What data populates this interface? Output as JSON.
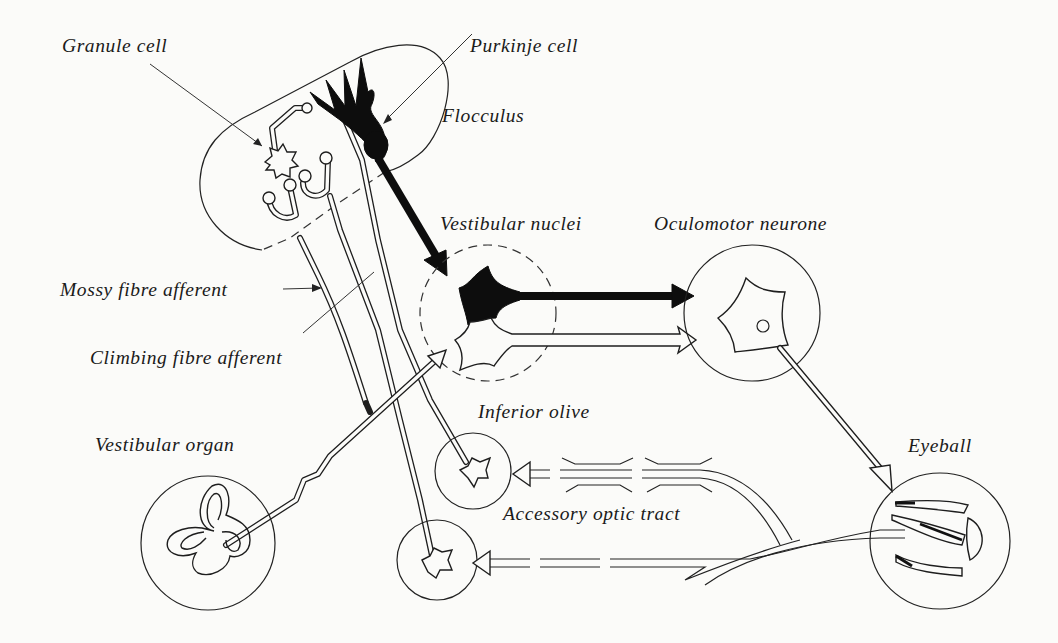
{
  "figure": {
    "type": "neuroanatomical schematic"
  },
  "labels": {
    "granule_cell": "Granule cell",
    "purkinje_cell": "Purkinje cell",
    "flocculus": "Flocculus",
    "vestibular_nuclei": "Vestibular nuclei",
    "oculomotor_neurone": "Oculomotor neurone",
    "mossy_fibre_afferent": "Mossy fibre afferent",
    "climbing_fibre_afferent": "Climbing fibre afferent",
    "inferior_olive": "Inferior olive",
    "vestibular_organ": "Vestibular organ",
    "eyeball": "Eyeball",
    "accessory_optic_tract": "Accessory optic tract"
  },
  "nodes": [
    {
      "id": "flocculus",
      "label": "Flocculus",
      "shape": "rounded-lobe",
      "border": "solid+dashed"
    },
    {
      "id": "vestibular_nuclei",
      "label": "Vestibular nuclei",
      "shape": "circle",
      "border": "dashed"
    },
    {
      "id": "oculomotor_neurone",
      "label": "Oculomotor neurone",
      "shape": "circle",
      "border": "solid"
    },
    {
      "id": "inferior_olive",
      "label": "Inferior olive",
      "shape": "circle",
      "border": "solid"
    },
    {
      "id": "pontine_relay",
      "label": "",
      "shape": "circle",
      "border": "solid"
    },
    {
      "id": "vestibular_organ",
      "label": "Vestibular organ",
      "shape": "circle",
      "border": "solid"
    },
    {
      "id": "eyeball",
      "label": "Eyeball",
      "shape": "circle",
      "border": "solid"
    }
  ],
  "edges": [
    {
      "from": "Purkinje cell",
      "to": "Vestibular nuclei",
      "style": "solid-black",
      "meaning": "inhibitory"
    },
    {
      "from": "Vestibular nuclei",
      "to": "Oculomotor neurone",
      "style": "solid-black"
    },
    {
      "from": "Vestibular nuclei",
      "to": "Oculomotor neurone",
      "style": "hollow"
    },
    {
      "from": "Vestibular organ",
      "to": "Vestibular nuclei",
      "style": "hollow"
    },
    {
      "from": "Vestibular organ",
      "to": "Flocculus",
      "style": "mossy fibre"
    },
    {
      "from": "Oculomotor neurone",
      "to": "Eyeball",
      "style": "hollow"
    },
    {
      "from": "Eyeball",
      "to": "Inferior olive",
      "style": "hollow",
      "via": "Accessory optic tract"
    },
    {
      "from": "Eyeball",
      "to": "pontine relay",
      "style": "hollow"
    },
    {
      "from": "Inferior olive",
      "to": "Flocculus",
      "style": "climbing fibre"
    },
    {
      "from": "pontine relay",
      "to": "Flocculus",
      "style": "mossy fibre"
    }
  ],
  "colors": {
    "background": "#fbfbf9",
    "ink": "#1e1e1e",
    "fill_black": "#0d0d0d"
  }
}
